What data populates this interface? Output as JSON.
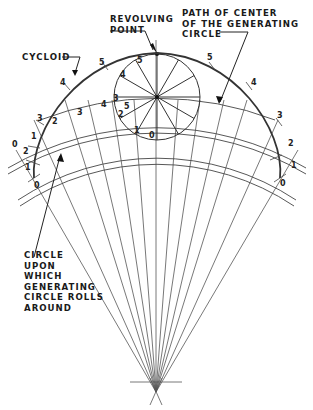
{
  "labels": {
    "revolving_point": "REVOLVING\nPOINT",
    "path_of_center": "PATH OF CENTER\nOF THE GENERATING\nCIRCLE",
    "cycloid": "CYCLOID",
    "base_circle": "CIRCLE\nUPON\nWHICH\nGENERATING\nCIRCLE ROLLS\nAROUND"
  },
  "generating_circle": {
    "division_numbers": [
      "0",
      "1",
      "2",
      "3",
      "4",
      "5"
    ]
  },
  "path_numbers_left": [
    "2",
    "3",
    "4",
    "5"
  ],
  "cycloid_points_left": [
    "0",
    "1",
    "2",
    "3",
    "4",
    "5"
  ],
  "cycloid_points_right": [
    "0",
    "1",
    "2",
    "3",
    "4",
    "5"
  ],
  "colors": {
    "line": "#333333",
    "curve": "#444444",
    "background": "#ffffff"
  }
}
